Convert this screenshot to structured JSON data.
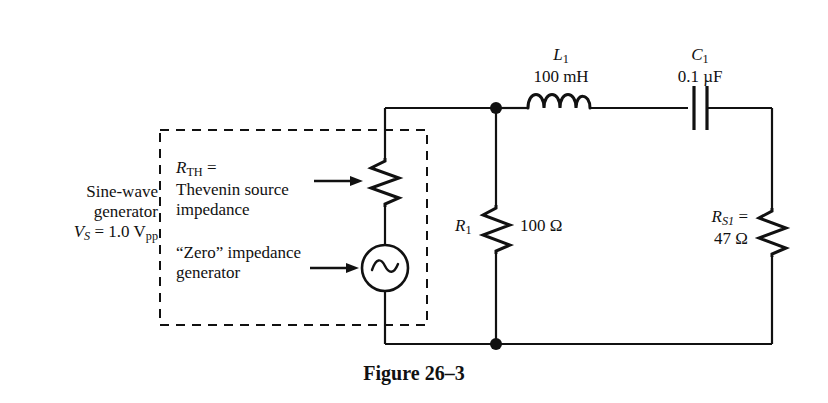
{
  "figure": {
    "caption": "Figure 26–3",
    "background_color": "#ffffff",
    "line_color": "#111111"
  },
  "generator_description": {
    "line1": "Sine-wave",
    "line2": "generator",
    "voltage_symbol": "V",
    "voltage_symbol_sub": "S",
    "voltage_value": " = 1.0 V",
    "voltage_value_sub": "pp"
  },
  "thevenin_callout": {
    "symbol": "R",
    "symbol_sub": "TH",
    "symbol_suffix": " =",
    "line2": "Thevenin source",
    "line3": "impedance",
    "arrow": "arrow-right-icon"
  },
  "zero_impedance_callout": {
    "line1": "“Zero” impedance",
    "line2": "generator",
    "arrow": "arrow-right-icon"
  },
  "components": {
    "inductor": {
      "designator": "L",
      "designator_sub": "1",
      "value": "100 mH",
      "symbol": "inductor-icon"
    },
    "capacitor": {
      "designator": "C",
      "designator_sub": "1",
      "value": "0.1 µF",
      "symbol": "capacitor-icon"
    },
    "resistor_r1": {
      "designator": "R",
      "designator_sub": "1",
      "value": "100 Ω",
      "symbol": "resistor-icon"
    },
    "resistor_rs1": {
      "designator": "R",
      "designator_sub": "S1",
      "designator_suffix": " =",
      "value": "47 Ω",
      "symbol": "resistor-icon"
    },
    "resistor_rth": {
      "symbol": "resistor-icon"
    },
    "ac_source": {
      "symbol": "ac-source-icon"
    }
  },
  "nodes": {
    "top_junction": "junction-dot",
    "bottom_junction": "junction-dot"
  },
  "dashed_box": {
    "label": "thevenin-equivalent-boundary",
    "style": "dashed"
  }
}
